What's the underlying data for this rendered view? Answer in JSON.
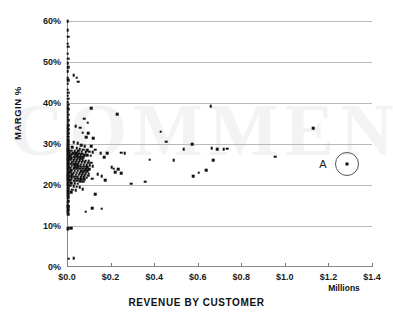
{
  "chart_data": {
    "type": "scatter",
    "title": "",
    "xlabel": "REVENUE BY CUSTOMER",
    "ylabel": "MARGIN %",
    "x_units": "Millions",
    "xlim": [
      0.0,
      1.4
    ],
    "ylim": [
      0.0,
      0.6
    ],
    "xticks": [
      0.0,
      0.2,
      0.4,
      0.6,
      0.8,
      1.0,
      1.2,
      1.4
    ],
    "xtick_labels": [
      "$0.0",
      "$0.2",
      "$0.4",
      "$0.6",
      "$0.8",
      "$1.0",
      "$1.2",
      "$1.4"
    ],
    "yticks": [
      0.0,
      0.1,
      0.2,
      0.3,
      0.4,
      0.5,
      0.6
    ],
    "ytick_labels": [
      "0%",
      "10%",
      "20%",
      "30%",
      "40%",
      "50%",
      "60%"
    ],
    "grid": "horizontal",
    "legend": "none",
    "marker_color": "#111111",
    "gridline_color": "#b9b9b9",
    "axis_color": "#8a8a8a",
    "annotations": [
      {
        "label": "A",
        "kind": "circled-point",
        "x": 1.285,
        "y": 0.252,
        "label_x": 1.175,
        "label_y": 0.252
      }
    ],
    "points": [
      [
        0.004,
        0.6
      ],
      [
        0.003,
        0.578
      ],
      [
        0.005,
        0.562
      ],
      [
        0.004,
        0.545
      ],
      [
        0.006,
        0.537
      ],
      [
        0.003,
        0.52
      ],
      [
        0.005,
        0.508
      ],
      [
        0.004,
        0.497
      ],
      [
        0.006,
        0.487
      ],
      [
        0.004,
        0.478
      ],
      [
        0.03,
        0.468
      ],
      [
        0.045,
        0.462
      ],
      [
        0.003,
        0.461
      ],
      [
        0.005,
        0.455
      ],
      [
        0.004,
        0.447
      ],
      [
        0.052,
        0.452
      ],
      [
        0.004,
        0.432
      ],
      [
        0.006,
        0.425
      ],
      [
        0.003,
        0.418
      ],
      [
        0.005,
        0.41
      ],
      [
        0.004,
        0.402
      ],
      [
        0.006,
        0.396
      ],
      [
        0.003,
        0.39
      ],
      [
        0.005,
        0.385
      ],
      [
        0.004,
        0.378
      ],
      [
        0.11,
        0.388
      ],
      [
        0.66,
        0.392
      ],
      [
        0.23,
        0.372
      ],
      [
        0.006,
        0.371
      ],
      [
        0.004,
        0.365
      ],
      [
        0.078,
        0.362
      ],
      [
        0.095,
        0.352
      ],
      [
        0.005,
        0.358
      ],
      [
        0.003,
        0.352
      ],
      [
        0.006,
        0.346
      ],
      [
        0.004,
        0.341
      ],
      [
        0.04,
        0.344
      ],
      [
        0.06,
        0.34
      ],
      [
        1.13,
        0.339
      ],
      [
        0.005,
        0.336
      ],
      [
        0.003,
        0.331
      ],
      [
        0.43,
        0.33
      ],
      [
        0.072,
        0.328
      ],
      [
        0.098,
        0.326
      ],
      [
        0.006,
        0.327
      ],
      [
        0.004,
        0.322
      ],
      [
        0.005,
        0.318
      ],
      [
        0.088,
        0.316
      ],
      [
        0.12,
        0.314
      ],
      [
        0.003,
        0.314
      ],
      [
        0.006,
        0.31
      ],
      [
        0.004,
        0.307
      ],
      [
        0.455,
        0.306
      ],
      [
        0.005,
        0.304
      ],
      [
        0.03,
        0.305
      ],
      [
        0.05,
        0.302
      ],
      [
        0.003,
        0.3
      ],
      [
        0.006,
        0.298
      ],
      [
        0.004,
        0.296
      ],
      [
        0.065,
        0.297
      ],
      [
        0.082,
        0.295
      ],
      [
        0.11,
        0.294
      ],
      [
        0.575,
        0.299
      ],
      [
        0.005,
        0.293
      ],
      [
        0.003,
        0.291
      ],
      [
        0.025,
        0.292
      ],
      [
        0.044,
        0.29
      ],
      [
        0.006,
        0.289
      ],
      [
        0.004,
        0.287
      ],
      [
        0.058,
        0.288
      ],
      [
        0.075,
        0.286
      ],
      [
        0.092,
        0.285
      ],
      [
        0.13,
        0.286
      ],
      [
        0.535,
        0.288
      ],
      [
        0.665,
        0.29
      ],
      [
        0.69,
        0.287
      ],
      [
        0.72,
        0.288
      ],
      [
        0.735,
        0.289
      ],
      [
        0.005,
        0.285
      ],
      [
        0.003,
        0.283
      ],
      [
        0.018,
        0.284
      ],
      [
        0.035,
        0.283
      ],
      [
        0.052,
        0.282
      ],
      [
        0.068,
        0.281
      ],
      [
        0.085,
        0.28
      ],
      [
        0.102,
        0.281
      ],
      [
        0.118,
        0.28
      ],
      [
        0.006,
        0.281
      ],
      [
        0.004,
        0.279
      ],
      [
        0.012,
        0.278
      ],
      [
        0.028,
        0.277
      ],
      [
        0.042,
        0.277
      ],
      [
        0.056,
        0.276
      ],
      [
        0.07,
        0.276
      ],
      [
        0.155,
        0.278
      ],
      [
        0.185,
        0.278
      ],
      [
        0.25,
        0.279
      ],
      [
        0.265,
        0.278
      ],
      [
        0.005,
        0.276
      ],
      [
        0.003,
        0.274
      ],
      [
        0.022,
        0.275
      ],
      [
        0.038,
        0.274
      ],
      [
        0.048,
        0.273
      ],
      [
        0.062,
        0.273
      ],
      [
        0.078,
        0.272
      ],
      [
        0.094,
        0.272
      ],
      [
        0.108,
        0.271
      ],
      [
        0.006,
        0.272
      ],
      [
        0.004,
        0.27
      ],
      [
        0.016,
        0.27
      ],
      [
        0.032,
        0.269
      ],
      [
        0.046,
        0.269
      ],
      [
        0.06,
        0.268
      ],
      [
        0.074,
        0.268
      ],
      [
        0.955,
        0.269
      ],
      [
        0.005,
        0.267
      ],
      [
        0.003,
        0.265
      ],
      [
        0.02,
        0.266
      ],
      [
        0.036,
        0.265
      ],
      [
        0.05,
        0.265
      ],
      [
        0.066,
        0.264
      ],
      [
        0.17,
        0.268
      ],
      [
        0.006,
        0.263
      ],
      [
        0.004,
        0.262
      ],
      [
        0.014,
        0.262
      ],
      [
        0.03,
        0.261
      ],
      [
        0.044,
        0.261
      ],
      [
        0.058,
        0.26
      ],
      [
        0.072,
        0.26
      ],
      [
        0.086,
        0.259
      ],
      [
        0.1,
        0.259
      ],
      [
        0.38,
        0.262
      ],
      [
        0.49,
        0.261
      ],
      [
        0.67,
        0.26
      ],
      [
        0.005,
        0.258
      ],
      [
        0.003,
        0.257
      ],
      [
        0.024,
        0.257
      ],
      [
        0.04,
        0.256
      ],
      [
        0.054,
        0.256
      ],
      [
        0.068,
        0.255
      ],
      [
        0.082,
        0.255
      ],
      [
        0.096,
        0.254
      ],
      [
        0.112,
        0.254
      ],
      [
        0.006,
        0.253
      ],
      [
        0.004,
        0.252
      ],
      [
        0.018,
        0.252
      ],
      [
        0.034,
        0.251
      ],
      [
        0.048,
        0.251
      ],
      [
        0.062,
        0.25
      ],
      [
        0.076,
        0.25
      ],
      [
        0.09,
        0.249
      ],
      [
        0.104,
        0.249
      ],
      [
        0.005,
        0.248
      ],
      [
        0.003,
        0.247
      ],
      [
        0.022,
        0.247
      ],
      [
        0.038,
        0.246
      ],
      [
        0.052,
        0.246
      ],
      [
        0.066,
        0.245
      ],
      [
        0.08,
        0.245
      ],
      [
        0.094,
        0.244
      ],
      [
        0.118,
        0.246
      ],
      [
        0.006,
        0.243
      ],
      [
        0.004,
        0.242
      ],
      [
        0.016,
        0.242
      ],
      [
        0.032,
        0.241
      ],
      [
        0.046,
        0.241
      ],
      [
        0.06,
        0.24
      ],
      [
        0.074,
        0.24
      ],
      [
        0.088,
        0.239
      ],
      [
        0.102,
        0.239
      ],
      [
        0.205,
        0.243
      ],
      [
        0.215,
        0.24
      ],
      [
        0.235,
        0.238
      ],
      [
        0.64,
        0.236
      ],
      [
        0.005,
        0.238
      ],
      [
        0.003,
        0.236
      ],
      [
        0.02,
        0.236
      ],
      [
        0.036,
        0.235
      ],
      [
        0.05,
        0.235
      ],
      [
        0.064,
        0.234
      ],
      [
        0.078,
        0.234
      ],
      [
        0.092,
        0.233
      ],
      [
        0.006,
        0.232
      ],
      [
        0.004,
        0.231
      ],
      [
        0.014,
        0.231
      ],
      [
        0.03,
        0.23
      ],
      [
        0.044,
        0.23
      ],
      [
        0.058,
        0.229
      ],
      [
        0.072,
        0.229
      ],
      [
        0.086,
        0.228
      ],
      [
        0.1,
        0.228
      ],
      [
        0.22,
        0.231
      ],
      [
        0.25,
        0.229
      ],
      [
        0.605,
        0.23
      ],
      [
        0.005,
        0.227
      ],
      [
        0.003,
        0.226
      ],
      [
        0.024,
        0.226
      ],
      [
        0.04,
        0.225
      ],
      [
        0.054,
        0.225
      ],
      [
        0.068,
        0.224
      ],
      [
        0.082,
        0.224
      ],
      [
        0.096,
        0.223
      ],
      [
        0.14,
        0.226
      ],
      [
        0.006,
        0.222
      ],
      [
        0.004,
        0.221
      ],
      [
        0.018,
        0.221
      ],
      [
        0.034,
        0.22
      ],
      [
        0.048,
        0.22
      ],
      [
        0.062,
        0.219
      ],
      [
        0.076,
        0.219
      ],
      [
        0.09,
        0.218
      ],
      [
        0.16,
        0.221
      ],
      [
        0.58,
        0.221
      ],
      [
        0.005,
        0.217
      ],
      [
        0.003,
        0.216
      ],
      [
        0.022,
        0.216
      ],
      [
        0.038,
        0.215
      ],
      [
        0.052,
        0.215
      ],
      [
        0.066,
        0.214
      ],
      [
        0.08,
        0.214
      ],
      [
        0.115,
        0.215
      ],
      [
        0.006,
        0.212
      ],
      [
        0.004,
        0.211
      ],
      [
        0.016,
        0.211
      ],
      [
        0.032,
        0.21
      ],
      [
        0.046,
        0.21
      ],
      [
        0.06,
        0.209
      ],
      [
        0.074,
        0.208
      ],
      [
        0.175,
        0.212
      ],
      [
        0.36,
        0.208
      ],
      [
        0.005,
        0.206
      ],
      [
        0.003,
        0.205
      ],
      [
        0.02,
        0.205
      ],
      [
        0.036,
        0.204
      ],
      [
        0.05,
        0.203
      ],
      [
        0.295,
        0.203
      ],
      [
        0.006,
        0.2
      ],
      [
        0.004,
        0.199
      ],
      [
        0.014,
        0.198
      ],
      [
        0.03,
        0.197
      ],
      [
        0.044,
        0.196
      ],
      [
        0.058,
        0.195
      ],
      [
        0.005,
        0.192
      ],
      [
        0.003,
        0.19
      ],
      [
        0.024,
        0.189
      ],
      [
        0.04,
        0.188
      ],
      [
        0.072,
        0.19
      ],
      [
        0.006,
        0.185
      ],
      [
        0.004,
        0.183
      ],
      [
        0.018,
        0.182
      ],
      [
        0.005,
        0.178
      ],
      [
        0.003,
        0.175
      ],
      [
        0.13,
        0.177
      ],
      [
        0.006,
        0.17
      ],
      [
        0.004,
        0.167
      ],
      [
        0.005,
        0.16
      ],
      [
        0.003,
        0.157
      ],
      [
        0.004,
        0.152
      ],
      [
        0.006,
        0.15
      ],
      [
        0.003,
        0.148
      ],
      [
        0.005,
        0.146
      ],
      [
        0.004,
        0.144
      ],
      [
        0.115,
        0.143
      ],
      [
        0.16,
        0.142
      ],
      [
        0.005,
        0.139
      ],
      [
        0.003,
        0.136
      ],
      [
        0.085,
        0.135
      ],
      [
        0.004,
        0.132
      ],
      [
        0.006,
        0.129
      ],
      [
        0.005,
        0.095
      ],
      [
        0.018,
        0.094
      ],
      [
        0.004,
        0.092
      ],
      [
        0.008,
        0.02
      ],
      [
        0.03,
        0.021
      ]
    ]
  },
  "watermark": {
    "text": "COMMENTS"
  }
}
